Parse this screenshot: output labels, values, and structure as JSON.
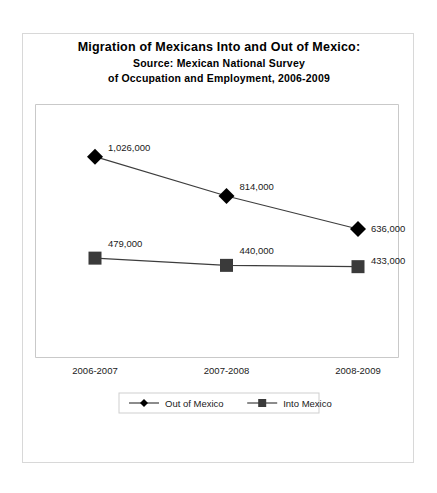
{
  "chart_data": {
    "type": "line",
    "title": "Migration of Mexicans Into and Out of Mexico:",
    "subtitle_line_1": "Source: Mexican National Survey",
    "subtitle_line_2": "of Occupation and Employment, 2006-2009",
    "categories": [
      "2006-2007",
      "2007-2008",
      "2008-2009"
    ],
    "series": [
      {
        "name": "Out of Mexico",
        "marker": "diamond",
        "color": "#000000",
        "values": [
          1026000,
          814000,
          636000
        ],
        "labels": [
          "1,026,000",
          "814,000",
          "636,000"
        ]
      },
      {
        "name": "Into Mexico",
        "marker": "square",
        "color": "#3a3a3a",
        "values": [
          479000,
          440000,
          433000
        ],
        "labels": [
          "479,000",
          "440,000",
          "433,000"
        ]
      }
    ],
    "xlabel": "",
    "ylabel": "",
    "ylim": [
      0,
      1200000
    ],
    "y_axis_visible": false,
    "grid": false,
    "legend_position": "bottom",
    "data_labels_shown": true
  },
  "legend": {
    "entries": [
      {
        "label": "Out of Mexico",
        "marker": "diamond-marker",
        "color": "#000000"
      },
      {
        "label": "Into Mexico",
        "marker": "square-marker",
        "color": "#3a3a3a"
      }
    ]
  },
  "colors": {
    "background": "#ffffff",
    "frame_border": "#d8d8d8",
    "axis": "#c9c9c9",
    "series_out": "#000000",
    "series_into": "#3a3a3a",
    "text": "#1a1a1a"
  }
}
